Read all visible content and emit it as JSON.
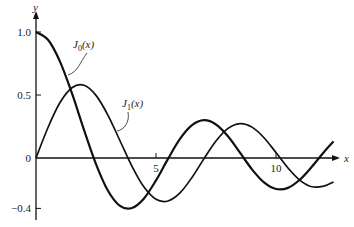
{
  "chart_data": {
    "type": "line",
    "title": "",
    "xlabel": "x",
    "ylabel": "y",
    "xlim": [
      0,
      12.6
    ],
    "ylim": [
      -0.45,
      1.05
    ],
    "x_ticks": [
      {
        "value": 5,
        "label": "5"
      },
      {
        "value": 10,
        "label": "10"
      }
    ],
    "y_ticks": [
      {
        "value": 1.0,
        "label": "1.0"
      },
      {
        "value": 0.5,
        "label": "0.5"
      },
      {
        "value": 0,
        "label": "0"
      },
      {
        "value": -0.4,
        "label": "−0.4"
      }
    ],
    "grid": false,
    "series": [
      {
        "name": "J0(x)",
        "label_main": "J",
        "label_sub": "0",
        "label_tail": "(x)",
        "x": [
          0,
          0.5,
          1,
          1.5,
          2,
          2.5,
          3,
          3.5,
          4,
          4.5,
          5,
          5.5,
          6,
          6.5,
          7,
          7.5,
          8,
          8.5,
          9,
          9.5,
          10,
          10.5,
          11,
          11.5,
          12,
          12.4
        ],
        "y": [
          1,
          0.938,
          0.765,
          0.512,
          0.224,
          -0.048,
          -0.26,
          -0.38,
          -0.397,
          -0.321,
          -0.178,
          -0.007,
          0.151,
          0.26,
          0.3,
          0.266,
          0.172,
          0.042,
          -0.09,
          -0.194,
          -0.246,
          -0.237,
          -0.171,
          -0.068,
          0.048,
          0.132
        ]
      },
      {
        "name": "J1(x)",
        "label_main": "J",
        "label_sub": "1",
        "label_tail": "(x)",
        "x": [
          0,
          0.5,
          1,
          1.5,
          2,
          2.5,
          3,
          3.5,
          4,
          4.5,
          5,
          5.5,
          6,
          6.5,
          7,
          7.5,
          8,
          8.5,
          9,
          9.5,
          10,
          10.5,
          11,
          11.5,
          12,
          12.4
        ],
        "y": [
          0,
          0.242,
          0.44,
          0.558,
          0.577,
          0.497,
          0.339,
          0.137,
          -0.066,
          -0.231,
          -0.328,
          -0.341,
          -0.277,
          -0.154,
          -0.005,
          0.135,
          0.235,
          0.273,
          0.245,
          0.161,
          0.043,
          -0.079,
          -0.177,
          -0.228,
          -0.223,
          -0.19
        ]
      }
    ]
  }
}
